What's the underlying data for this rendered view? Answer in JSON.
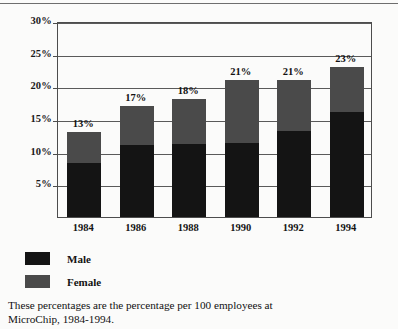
{
  "figure": {
    "caption_line1": "These percentages are the percentage per 100 employees at",
    "caption_line2": "MicroChip, 1984-1994."
  },
  "legend": {
    "items": [
      {
        "label": "Male",
        "color": "#141414"
      },
      {
        "label": "Female",
        "color": "#4a4a4a"
      }
    ]
  },
  "chart_data": {
    "type": "bar",
    "stacked": true,
    "title": "",
    "xlabel": "",
    "ylabel": "",
    "categories": [
      "1984",
      "1986",
      "1988",
      "1990",
      "1992",
      "1994"
    ],
    "series": [
      {
        "name": "Male",
        "color": "#141414",
        "values": [
          8.3,
          11.0,
          11.2,
          11.4,
          13.2,
          16.0
        ]
      },
      {
        "name": "Female",
        "color": "#4a4a4a",
        "values": [
          4.7,
          6.0,
          6.8,
          9.6,
          7.8,
          7.0
        ]
      }
    ],
    "totals": [
      13,
      17,
      18,
      21,
      21,
      23
    ],
    "total_labels": [
      "13%",
      "17%",
      "18%",
      "21%",
      "21%",
      "23%"
    ],
    "ylim": [
      0,
      30
    ],
    "yticks": [
      5,
      10,
      15,
      20,
      25,
      30
    ],
    "ytick_labels": [
      "5%",
      "10%",
      "15%",
      "20%",
      "25%",
      "30%"
    ],
    "grid": true,
    "legend_position": "below-left"
  }
}
